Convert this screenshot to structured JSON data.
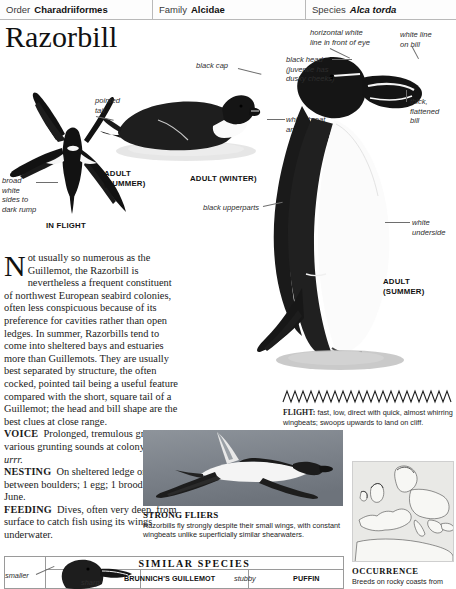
{
  "taxonomy": {
    "order_key": "Order",
    "order_value": "Charadriiformes",
    "family_key": "Family",
    "family_value": "Alcidae",
    "species_key": "Species",
    "species_value": "Alca torda"
  },
  "title": "Razorbill",
  "annotations": {
    "broad_white": "broad\nwhite\nsides to\ndark rump",
    "pointed_tail": "pointed\ntail",
    "black_cap": "black cap",
    "white_throat": "white throat\nand breast",
    "horizontal_white_line": "horizontal white\nline in front of eye",
    "white_line_bill": "white line\non bill",
    "black_head": "black head\n(juvenile has\ndusky cheeks)",
    "thick_bill": "thick,\nflattened\nbill",
    "black_upperparts": "black upperparts",
    "white_underside": "white\nunderside"
  },
  "captions": {
    "in_flight": "IN FLIGHT",
    "adult_summer_flight": "ADULT\n(SUMMER)",
    "adult_winter": "ADULT (WINTER)",
    "adult_summer_standing": "ADULT\n(SUMMER)"
  },
  "body": {
    "dropcap": "N",
    "intro": "ot usually so numerous as the Guillemot, the Razorbill is nevertheless a frequent constituent of northwest European seabird colonies, often less conspicuous because of its preference for cavities rather than open ledges. In summer, Razorbills tend to come into sheltered bays and estuaries more than Guillemots. They are usually best separated by structure, the often cocked, pointed tail being a useful feature compared with the short, square tail of a Guillemot; the head and bill shape are the best clues at close range.",
    "voice_label": "VOICE",
    "voice_text": "Prolonged, tremulous growls and various grunting sounds at colony, deep",
    "voice_italic": "urrr.",
    "nesting_label": "NESTING",
    "nesting_text": "On sheltered ledge or cavity between boulders; 1 egg; 1 brood; May–June.",
    "feeding_label": "FEEDING",
    "feeding_text": "Dives, often very deep, from surface to catch fish using its wings underwater."
  },
  "flight": {
    "label": "FLIGHT:",
    "text": "fast, low, direct with quick, almost whirring wingbeats; swoops upwards to land on cliff."
  },
  "photo_caption": {
    "title": "STRONG FLIERS",
    "text": "Razorbills fly strongly despite their small wings, with constant wingbeats unlike superficially similar shearwaters."
  },
  "similar_species": {
    "title": "SIMILAR SPECIES",
    "smaller_label": "smaller",
    "sharp_label": "sharp",
    "brunnichs_name": "BRUNNICH'S GUILLEMOT",
    "stubby_label": "stubby",
    "puffin_name": "PUFFIN"
  },
  "occurrence": {
    "title": "OCCURRENCE",
    "text": "Breeds on rocky coasts from"
  },
  "colors": {
    "ink": "#1a1a1a",
    "rule": "#b9b9b9",
    "bird_black": "#121212",
    "bird_white": "#fbfbfb",
    "map_land": "#efefec",
    "photo_grey": "#8d9299"
  }
}
